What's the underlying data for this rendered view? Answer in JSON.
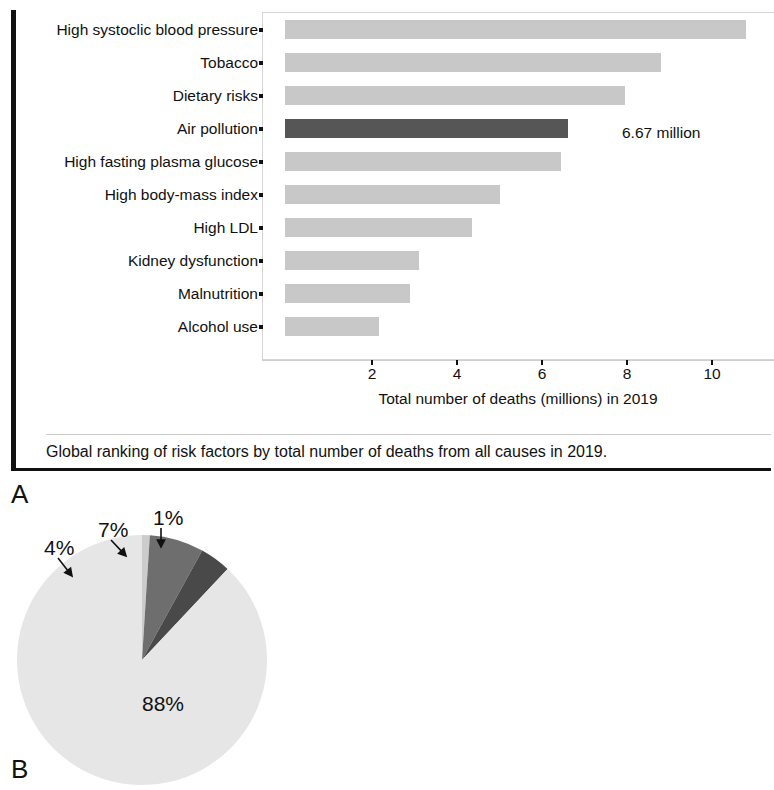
{
  "figure": {
    "panel_a_letter": "A",
    "panel_b_letter": "B",
    "panel_a_caption": "Global ranking of risk factors by total number of deaths from all causes in 2019."
  },
  "chart_data": [
    {
      "type": "bar",
      "orientation": "horizontal",
      "title": "",
      "xlabel": "Total number of deaths (millions) in 2019",
      "ylabel": "",
      "xlim": [
        0,
        11.3
      ],
      "xticks": [
        2,
        4,
        6,
        8,
        10
      ],
      "xtick_labels": [
        "2",
        "4",
        "6",
        "8",
        "10"
      ],
      "grid": false,
      "legend": "none",
      "categories": [
        "High systoclic blood pressure",
        "Tobacco",
        "Dietary risks",
        "Air pollution",
        "High fasting plasma glucose",
        "High body-mass index",
        "High LDL",
        "Kidney dysfunction",
        "Malnutrition",
        "Alcohol use"
      ],
      "values": [
        10.85,
        8.85,
        8.0,
        6.67,
        6.5,
        5.05,
        4.4,
        3.15,
        2.95,
        2.2
      ],
      "highlight_index": 3,
      "annotations": [
        {
          "text": "6.67 million",
          "category": "Air pollution",
          "value": 6.67
        }
      ],
      "colors": {
        "bar": "#c8c8c8",
        "highlight": "#565656",
        "axis": "#cfcfcf",
        "text": "#111111"
      }
    },
    {
      "type": "pie",
      "title": "",
      "labels": [
        "Ambient ozone",
        "Ambient PM2.5",
        "Household air pollution",
        "Other risk factors"
      ],
      "values": [
        1,
        7,
        4,
        88
      ],
      "value_labels": [
        "1%",
        "7%",
        "4%",
        "88%"
      ],
      "legend_position": "right",
      "start_angle_deg": -90,
      "direction": "counterclockwise",
      "colors": [
        "#cccccc",
        "#6e6e6e",
        "#494949",
        "#e6e6e6"
      ]
    }
  ],
  "panel_b": {
    "legend": [
      {
        "label_html": "Ambient ozone",
        "color": "#cccccc"
      },
      {
        "label_html": "Ambient PM<sub>2.5</sub>",
        "color": "#6e6e6e"
      },
      {
        "label_html": "Household air pollution",
        "color": "#494949"
      },
      {
        "label_html": "Other risk factors",
        "color": "#e6e6e6"
      }
    ],
    "pie_labels": [
      {
        "text": "1%",
        "x": 145,
        "y": 6
      },
      {
        "text": "7%",
        "x": 90,
        "y": 18
      },
      {
        "text": "4%",
        "x": 36,
        "y": 36
      },
      {
        "text": "88%",
        "x": 134,
        "y": 192
      }
    ]
  }
}
